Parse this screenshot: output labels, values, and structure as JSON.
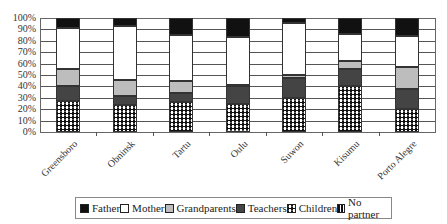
{
  "chart_data": {
    "type": "bar",
    "stacked": true,
    "percent": true,
    "title": "",
    "xlabel": "",
    "ylabel": "",
    "ylim": [
      0,
      100
    ],
    "yticks": [
      "0%",
      "10%",
      "20%",
      "30%",
      "40%",
      "50%",
      "60%",
      "70%",
      "80%",
      "90%",
      "100%"
    ],
    "grid": true,
    "legend_position": "bottom",
    "categories": [
      "Greensboro",
      "Obninsk",
      "Tartu",
      "Oulu",
      "Suwon",
      "Kisumu",
      "Porto Alegre"
    ],
    "series": [
      {
        "name": "Children",
        "color": "#111111",
        "pattern": "dots",
        "values": [
          27,
          24,
          26,
          25,
          30,
          40,
          20
        ]
      },
      {
        "name": "Teachers",
        "color": "#444444",
        "values": [
          13,
          8,
          8,
          15,
          17,
          15,
          18
        ]
      },
      {
        "name": "Grandparents",
        "color": "#bdbdbd",
        "values": [
          15,
          14,
          11,
          1,
          3,
          7,
          19
        ]
      },
      {
        "name": "Mother",
        "color": "#ffffff",
        "values": [
          36,
          47,
          40,
          42,
          46,
          24,
          27
        ]
      },
      {
        "name": "Father",
        "color": "#111111",
        "values": [
          9,
          7,
          15,
          17,
          4,
          14,
          16
        ]
      },
      {
        "name": "No partner",
        "color": "#ffffff",
        "pattern": "vertical-stripes",
        "values": [
          0,
          0,
          0,
          0,
          0,
          0,
          0
        ]
      }
    ],
    "legend": [
      "Father",
      "Mother",
      "Grandparents",
      "Teachers",
      "Children",
      "No partner"
    ]
  }
}
